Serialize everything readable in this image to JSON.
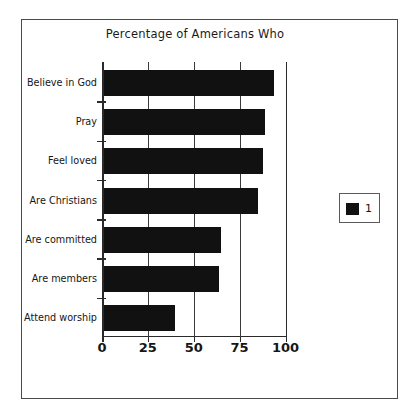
{
  "figure": {
    "background_color": "#ffffff",
    "frame_color": "#4a4a4a",
    "bar_color": "#111111"
  },
  "legend": {
    "entries": [
      {
        "label": "1",
        "color": "#111111",
        "swatch_icon": "filled-square-icon"
      }
    ],
    "position": "right"
  },
  "chart_data": {
    "type": "bar",
    "orientation": "horizontal",
    "title": "Percentage of Americans Who",
    "xlabel": "",
    "ylabel": "",
    "xlim": [
      0,
      100
    ],
    "ylim": [
      0,
      7
    ],
    "grid": true,
    "xticks": [
      "0",
      "25",
      "50",
      "75",
      "100"
    ],
    "xtick_values": [
      0,
      25,
      50,
      75,
      100
    ],
    "categories": [
      "Believe in God",
      "Pray",
      "Feel loved",
      "Are  Christians",
      "Are committed",
      "Are members",
      "Attend worship"
    ],
    "series": [
      {
        "name": "1",
        "color": "#111111",
        "values": [
          94,
          89,
          88,
          85,
          65,
          64,
          40
        ]
      }
    ],
    "legend_position": "right"
  }
}
